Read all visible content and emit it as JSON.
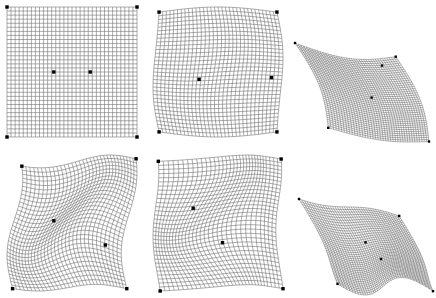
{
  "figure": {
    "background_color": "#ffffff",
    "grid_line_color": "#4a4a4a",
    "control_point_color": "#000000",
    "layout": {
      "rows": 2,
      "cols": 3,
      "width": 436,
      "height": 298
    }
  },
  "panels": [
    {
      "id": "panel-1",
      "name": "undeformed-square-lattice",
      "position": {
        "x": 4,
        "y": 4,
        "width": 136,
        "height": 136
      },
      "mesh": {
        "nu": 33,
        "nv": 33,
        "type": "quad-mesh"
      },
      "deformation": "none",
      "control_points": [
        {
          "u": 0.0,
          "v": 0.0
        },
        {
          "u": 1.0,
          "v": 0.0
        },
        {
          "u": 0.0,
          "v": 1.0
        },
        {
          "u": 1.0,
          "v": 1.0
        },
        {
          "u": 0.36,
          "v": 0.5
        },
        {
          "u": 0.64,
          "v": 0.5
        }
      ]
    },
    {
      "id": "panel-2",
      "name": "barrel-bulge-lattice",
      "position": {
        "x": 150,
        "y": 4,
        "width": 136,
        "height": 136
      },
      "mesh": {
        "nu": 33,
        "nv": 33,
        "type": "quad-mesh"
      },
      "deformation": "barrel-bulge",
      "control_points": [
        {
          "u": 0.0,
          "v": 0.0
        },
        {
          "u": 1.0,
          "v": 0.0
        },
        {
          "u": 0.0,
          "v": 1.0
        },
        {
          "u": 1.0,
          "v": 1.0
        },
        {
          "u": 0.36,
          "v": 0.55
        },
        {
          "u": 0.92,
          "v": 0.55
        }
      ]
    },
    {
      "id": "panel-3",
      "name": "sheared-projected-lattice",
      "position": {
        "x": 292,
        "y": 40,
        "width": 140,
        "height": 105
      },
      "mesh": {
        "nu": 41,
        "nv": 41,
        "type": "quad-mesh"
      },
      "deformation": "shear-projection",
      "control_points": [
        {
          "u": 0.0,
          "v": 0.0
        },
        {
          "u": 1.0,
          "v": 0.0
        },
        {
          "u": 0.0,
          "v": 1.0
        },
        {
          "u": 1.0,
          "v": 1.0
        },
        {
          "u": 0.5,
          "v": 0.48
        },
        {
          "u": 0.8,
          "v": 0.08
        }
      ]
    },
    {
      "id": "panel-4",
      "name": "s-curve-warped-lattice",
      "position": {
        "x": 4,
        "y": 152,
        "width": 136,
        "height": 142
      },
      "mesh": {
        "nu": 33,
        "nv": 33,
        "type": "quad-mesh"
      },
      "deformation": "s-curve-twist",
      "control_points": [
        {
          "u": 0.0,
          "v": 0.0
        },
        {
          "u": 1.0,
          "v": 0.0
        },
        {
          "u": 0.0,
          "v": 1.0
        },
        {
          "u": 1.0,
          "v": 1.0
        },
        {
          "u": 0.35,
          "v": 0.42
        },
        {
          "u": 0.88,
          "v": 0.7
        }
      ]
    },
    {
      "id": "panel-5",
      "name": "wave-folded-lattice",
      "position": {
        "x": 150,
        "y": 152,
        "width": 136,
        "height": 142
      },
      "mesh": {
        "nu": 33,
        "nv": 33,
        "type": "quad-mesh"
      },
      "deformation": "vertical-wave-fold",
      "control_points": [
        {
          "u": 0.0,
          "v": 0.0
        },
        {
          "u": 1.0,
          "v": 0.0
        },
        {
          "u": 0.0,
          "v": 1.0
        },
        {
          "u": 1.0,
          "v": 1.0
        },
        {
          "u": 0.32,
          "v": 0.36
        },
        {
          "u": 0.62,
          "v": 0.68
        }
      ]
    },
    {
      "id": "panel-6",
      "name": "sheared-wave-surface-lattice",
      "position": {
        "x": 296,
        "y": 196,
        "width": 140,
        "height": 102
      },
      "mesh": {
        "nu": 41,
        "nv": 41,
        "type": "quad-mesh"
      },
      "deformation": "sheared-wave-surface",
      "control_points": [
        {
          "u": 0.0,
          "v": 0.0
        },
        {
          "u": 1.0,
          "v": 0.0
        },
        {
          "u": 0.0,
          "v": 1.0
        },
        {
          "u": 1.0,
          "v": 1.0
        },
        {
          "u": 0.46,
          "v": 0.36
        },
        {
          "u": 0.56,
          "v": 0.62
        }
      ]
    }
  ]
}
